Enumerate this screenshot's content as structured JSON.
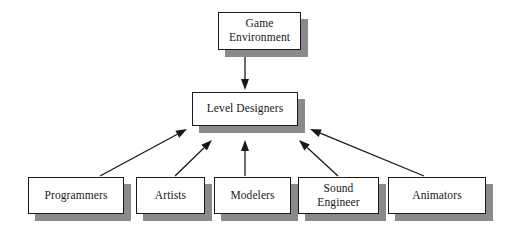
{
  "diagram": {
    "background_color": "#ffffff",
    "box_fill": "#ffffff",
    "box_border_color": "#1a1a1a",
    "shadow_color": "#8a8a8a",
    "arrow_color": "#17181a",
    "nodes": [
      {
        "id": "game-environment",
        "label": "Game\nEnvironment",
        "x": 218,
        "y": 12,
        "w": 83,
        "h": 38
      },
      {
        "id": "level-designers",
        "label": "Level Designers",
        "x": 192,
        "y": 92,
        "w": 106,
        "h": 34
      },
      {
        "id": "programmers",
        "label": "Programmers",
        "x": 28,
        "y": 177,
        "w": 96,
        "h": 37
      },
      {
        "id": "artists",
        "label": "Artists",
        "x": 136,
        "y": 177,
        "w": 69,
        "h": 37
      },
      {
        "id": "modelers",
        "label": "Modelers",
        "x": 214,
        "y": 177,
        "w": 77,
        "h": 37
      },
      {
        "id": "sound-engineer",
        "label": "Sound\nEngineer",
        "x": 298,
        "y": 177,
        "w": 81,
        "h": 37
      },
      {
        "id": "animators",
        "label": "Animators",
        "x": 388,
        "y": 177,
        "w": 98,
        "h": 37
      }
    ],
    "edges": [
      {
        "id": "edge-game-environment-to-level-designers",
        "from": "game-environment",
        "to": "level-designers",
        "x1": 245,
        "y1": 50,
        "x2": 245,
        "y2": 90
      },
      {
        "id": "edge-programmers-to-level-designers",
        "from": "programmers",
        "to": "level-designers",
        "x1": 100,
        "y1": 176,
        "x2": 187,
        "y2": 129
      },
      {
        "id": "edge-artists-to-level-designers",
        "from": "artists",
        "to": "level-designers",
        "x1": 175,
        "y1": 176,
        "x2": 212,
        "y2": 140
      },
      {
        "id": "edge-modelers-to-level-designers",
        "from": "modelers",
        "to": "level-designers",
        "x1": 245,
        "y1": 176,
        "x2": 245,
        "y2": 140
      },
      {
        "id": "edge-sound-engineer-to-level-designers",
        "from": "sound-engineer",
        "to": "level-designers",
        "x1": 338,
        "y1": 176,
        "x2": 299,
        "y2": 140
      },
      {
        "id": "edge-animators-to-level-designers",
        "from": "animators",
        "to": "level-designers",
        "x1": 424,
        "y1": 176,
        "x2": 310,
        "y2": 129
      }
    ]
  }
}
